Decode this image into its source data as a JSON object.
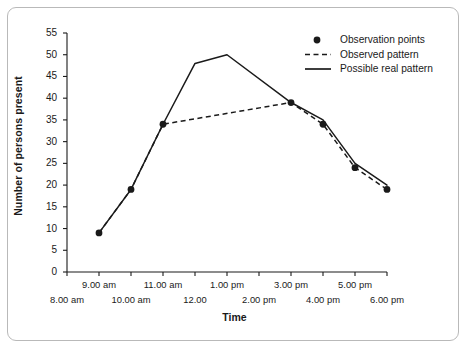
{
  "figure": {
    "y_axis_title": "Number of persons present",
    "x_axis_title": "Time",
    "border_color": "#b9b9b9",
    "ink_color": "#1a1a1a"
  },
  "legend": {
    "items": [
      {
        "label": "Observation points",
        "marker": "dot-marker"
      },
      {
        "label": "Observed pattern",
        "marker": "dashed-line-marker"
      },
      {
        "label": "Possible real pattern",
        "marker": "solid-line-marker"
      }
    ]
  },
  "chart_data": {
    "type": "line",
    "title": "",
    "xlabel": "Time",
    "ylabel": "Number of persons present",
    "xlim": [
      8,
      18
    ],
    "ylim": [
      0,
      55
    ],
    "grid": false,
    "legend_position": "top-right",
    "y_ticks": [
      0,
      5,
      10,
      15,
      20,
      25,
      30,
      35,
      40,
      45,
      50,
      55
    ],
    "x_ticks": [
      8,
      9,
      10,
      11,
      12,
      13,
      14,
      15,
      16,
      17,
      18
    ],
    "x_tick_labels_upper": [
      "9.00 am",
      "11.00 am",
      "1.00 pm",
      "3.00 pm",
      "5.00 pm"
    ],
    "x_tick_labels_upper_values": [
      9,
      11,
      13,
      15,
      17
    ],
    "x_tick_labels_lower": [
      "8.00 am",
      "10.00 am",
      "12.00",
      "2.00 pm",
      "4.00 pm",
      "6.00 pm"
    ],
    "x_tick_labels_lower_values": [
      8,
      10,
      12,
      14,
      16,
      18
    ],
    "series": [
      {
        "name": "Observation points",
        "style": "markers",
        "x": [
          9,
          10,
          11,
          15,
          16,
          17,
          18
        ],
        "values": [
          9,
          19,
          34,
          39,
          34,
          24,
          19
        ]
      },
      {
        "name": "Observed pattern",
        "style": "dashed",
        "x": [
          9,
          10,
          11,
          15,
          16,
          17,
          18
        ],
        "values": [
          9,
          19,
          34,
          39,
          34,
          24,
          19
        ]
      },
      {
        "name": "Possible real pattern",
        "style": "solid",
        "x": [
          9,
          10,
          11,
          12,
          13,
          15,
          16,
          17,
          18
        ],
        "values": [
          9,
          19,
          34,
          48,
          50,
          39,
          35,
          25,
          20
        ]
      }
    ]
  }
}
